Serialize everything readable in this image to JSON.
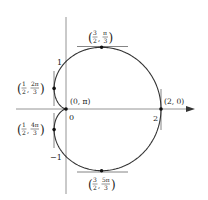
{
  "diagram": {
    "title": "",
    "curve": {
      "equation": "r = 1 + cos θ",
      "type": "cardioid",
      "color": "#333333"
    },
    "axes": {
      "x_ticks": [
        {
          "value": 0,
          "label": "0"
        },
        {
          "value": 2,
          "label": "2"
        }
      ],
      "y_ticks": [
        {
          "value": 1,
          "label": "1"
        },
        {
          "value": -1,
          "label": "−1"
        }
      ],
      "axis_color": "#888888"
    },
    "points": [
      {
        "id": "top",
        "r_num": "3",
        "r_den": "2",
        "theta_num": "π",
        "theta_den": "3",
        "tangent": "horizontal"
      },
      {
        "id": "upper-left",
        "r_num": "1",
        "r_den": "2",
        "theta_num": "2π",
        "theta_den": "3",
        "tangent": "vertical"
      },
      {
        "id": "pole",
        "label": "(0, π)",
        "tangent": "none"
      },
      {
        "id": "right",
        "label": "(2, 0)",
        "tangent": "vertical"
      },
      {
        "id": "lower-left",
        "r_num": "1",
        "r_den": "2",
        "theta_num": "4π",
        "theta_den": "3",
        "tangent": "vertical"
      },
      {
        "id": "bottom",
        "r_num": "3",
        "r_den": "2",
        "theta_num": "5π",
        "theta_den": "3",
        "tangent": "horizontal"
      }
    ]
  }
}
